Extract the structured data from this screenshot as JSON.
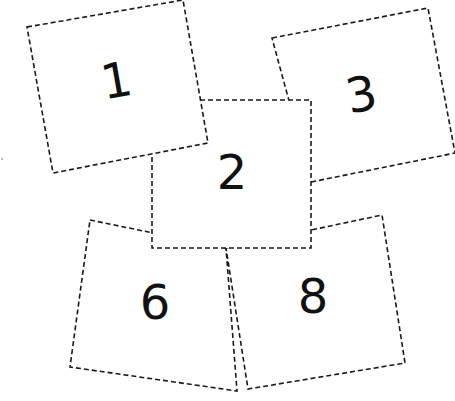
{
  "canvas": {
    "width": 455,
    "height": 401,
    "background": "#ffffff"
  },
  "style": {
    "stroke": "#1a1a1a",
    "number_color": "#111111",
    "dash": "dashed"
  },
  "cards": [
    {
      "id": "card-3",
      "number": "3",
      "points": "272,38 428,8 455,153 311,182",
      "label_x": 362,
      "label_y": 98,
      "rotate": -11
    },
    {
      "id": "card-6",
      "number": "6",
      "points": "90,220 226,248 237,391 70,367",
      "label_x": 155,
      "label_y": 306,
      "rotate": 0
    },
    {
      "id": "card-8",
      "number": "8",
      "points": "226,248 382,215 405,363 248,389",
      "label_x": 313,
      "label_y": 300,
      "rotate": 0
    },
    {
      "id": "card-2",
      "number": "2",
      "points": "152,100 311,100 311,248 152,248",
      "label_x": 232,
      "label_y": 176,
      "rotate": 0
    },
    {
      "id": "card-1",
      "number": "1",
      "points": "27,27 183,0 208,143 53,173",
      "label_x": 117,
      "label_y": 84,
      "rotate": -10
    }
  ]
}
